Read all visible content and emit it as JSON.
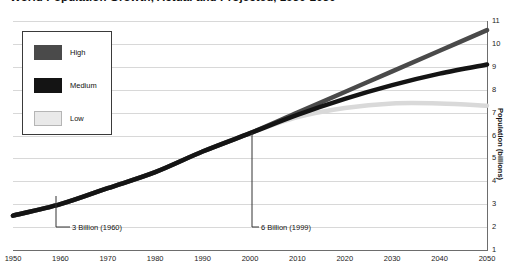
{
  "chart_title": "World Population Growth, Actual and Projected, 1950-2050",
  "axis": {
    "y_title": "Population (billions)",
    "y_ticks": [
      "11",
      "10",
      "9",
      "8",
      "7",
      "6",
      "5",
      "4",
      "3",
      "2",
      "1"
    ],
    "x_ticks": [
      "1950",
      "1960",
      "1970",
      "1980",
      "1990",
      "2000",
      "2010",
      "2020",
      "2030",
      "2040",
      "2050"
    ]
  },
  "legend": {
    "items": [
      {
        "label": "High",
        "color": "#4a4a4a"
      },
      {
        "label": "Medium",
        "color": "#141414"
      },
      {
        "label": "Low",
        "color": "#e9e9e9"
      }
    ]
  },
  "annotations": [
    {
      "text": "3 Billion (1960)"
    },
    {
      "text": "6 Billion (1999)"
    }
  ],
  "colors": {
    "high": "#4a4a4a",
    "medium": "#141414",
    "low": "#d9d9d9",
    "grid": "#d8d8d8",
    "axis": "#6d6d6d",
    "background": "#ffffff"
  },
  "chart_data": {
    "type": "line",
    "title": "World Population Growth, Actual and Projected, 1950-2050",
    "xlabel": "",
    "ylabel": "Population (billions)",
    "xlim": [
      1950,
      2050
    ],
    "ylim": [
      1,
      11
    ],
    "grid": true,
    "legend_position": "top-left",
    "x": [
      1950,
      1960,
      1970,
      1980,
      1990,
      2000,
      2010,
      2020,
      2030,
      2040,
      2050
    ],
    "series": [
      {
        "name": "High",
        "color": "#4a4a4a",
        "values": [
          2.5,
          3.0,
          3.7,
          4.4,
          5.3,
          6.1,
          7.0,
          7.9,
          8.8,
          9.7,
          10.6
        ]
      },
      {
        "name": "Medium",
        "color": "#141414",
        "values": [
          2.5,
          3.0,
          3.7,
          4.4,
          5.3,
          6.1,
          6.9,
          7.6,
          8.2,
          8.7,
          9.1
        ]
      },
      {
        "name": "Low",
        "color": "#d9d9d9",
        "values": [
          2.5,
          3.0,
          3.7,
          4.4,
          5.3,
          6.1,
          6.8,
          7.2,
          7.4,
          7.4,
          7.3
        ]
      }
    ],
    "annotations": [
      {
        "text": "3 Billion (1960)",
        "x": 1960,
        "y": 3.0
      },
      {
        "text": "6 Billion (1999)",
        "x": 1999,
        "y": 6.0
      }
    ]
  }
}
